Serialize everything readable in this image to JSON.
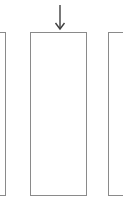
{
  "canvas": {
    "width": 123,
    "height": 206,
    "background_color": "#ffffff"
  },
  "diagram": {
    "stroke_color": "#8a8a8a",
    "stroke_width": 1,
    "rectangles": [
      {
        "name": "left-column",
        "left": -10,
        "top": 32,
        "width": 16,
        "height": 164,
        "clipped_edge": "left"
      },
      {
        "name": "middle-column",
        "left": 30,
        "top": 32,
        "width": 57,
        "height": 164,
        "clipped_edge": "none"
      },
      {
        "name": "right-column",
        "left": 108,
        "top": 32,
        "width": 26,
        "height": 164,
        "clipped_edge": "right"
      }
    ],
    "arrow": {
      "direction": "down",
      "color": "#3f3f3f",
      "stroke_width": 1.4,
      "x": 60,
      "y_start": 5,
      "y_tip": 29,
      "head_half_width": 4.5,
      "head_height": 6
    }
  }
}
